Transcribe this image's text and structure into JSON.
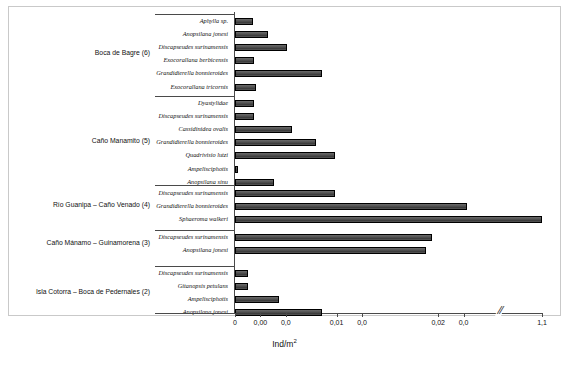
{
  "chart_data": {
    "type": "bar",
    "orientation": "horizontal",
    "title": "",
    "xlabel": "Ind/m",
    "xlabel_sup": "2",
    "ylabel": "",
    "xlim": [
      0,
      0.025
    ],
    "axis_break": true,
    "axis_break_marker": "//",
    "grid": false,
    "legend": "none",
    "tick_labels": [
      "0",
      "0,00",
      "0,0",
      "0,01",
      "0,0",
      "0,02",
      "0,0",
      "1,1"
    ],
    "tick_values": [
      0,
      0.0025,
      0.005,
      0.01,
      0.0125,
      0.02,
      0.0225,
      1.1
    ],
    "groups": [
      {
        "label": "Boca de Bagre (6)",
        "count": 6,
        "categories": [
          "Aphylla sp.",
          "Anopsilana jonesi",
          "Discapseudes surinamensis",
          "Exocorallana berbicensis",
          "Grandidierella bonnieroides",
          "Exocorallana tricornis"
        ],
        "values": [
          0.0018,
          0.0032,
          0.0051,
          0.0019,
          0.0086,
          0.0021
        ]
      },
      {
        "label": "Caño Manamito (5)",
        "count": 5,
        "categories": [
          "Dyastylidae",
          "Discapseudes surinamensis",
          "Cassidinidea ovalis",
          "Grandidierella bonnieroides",
          "Quadrivisio lutzi",
          "Ampelisciphotis",
          "Anopsilana sinu"
        ],
        "values": [
          0.0019,
          0.0019,
          0.0056,
          0.008,
          0.0098,
          0.0003,
          0.0038
        ]
      },
      {
        "label": "Río Guanipa – Caño Venado (4)",
        "count": 4,
        "categories": [
          "Discapseudes surinamensis",
          "Grandidierella bonnieroides",
          "Sphaeroma walkeri"
        ],
        "values": [
          0.0098,
          0.0228,
          1.1
        ]
      },
      {
        "label": "Caño Mánamo – Guinamorena (3)",
        "count": 3,
        "categories": [
          "Discapseudes surinamensis",
          "Anopsilana jonesi"
        ],
        "values": [
          0.0194,
          0.0188
        ]
      },
      {
        "label": "Isla Cotorra – Boca de Pedernales (2)",
        "count": 2,
        "categories": [
          "Discapseudes surinamensis",
          "Gitanopsis petulans",
          "Ampelisciphotis",
          "Anopsilana jonesi"
        ],
        "values": [
          0.0013,
          0.0013,
          0.0043,
          0.0086
        ]
      }
    ]
  },
  "colors": {
    "bar_fill": "#4f4f4f",
    "bar_stroke": "#000000",
    "axis": "#4a4a4a",
    "frame": "#c9c9c9",
    "text": "#111111",
    "background": "#ffffff"
  }
}
